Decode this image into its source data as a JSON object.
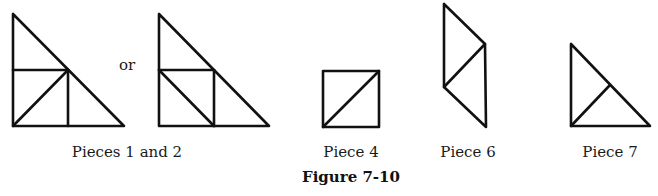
{
  "figure": {
    "caption": "Figure 7-10",
    "connector": "or",
    "labels": {
      "pieces_1_2": "Pieces 1 and 2",
      "piece_4": "Piece 4",
      "piece_6": "Piece 6",
      "piece_7": "Piece 7"
    },
    "stroke_color": "#111111",
    "pieces": [
      {
        "name": "Pieces 1 and 2 (option A)",
        "shape": "right triangle divided into small triangles and square regions"
      },
      {
        "name": "Pieces 1 and 2 (option B)",
        "shape": "right triangle divided with alternate diagonal"
      },
      {
        "name": "Piece 4",
        "shape": "square with diagonal"
      },
      {
        "name": "Piece 6",
        "shape": "parallelogram divided into two triangles"
      },
      {
        "name": "Piece 7",
        "shape": "right triangle divided into two triangles"
      }
    ]
  }
}
